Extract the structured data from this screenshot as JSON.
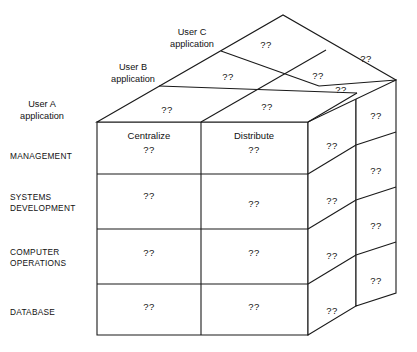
{
  "diagram": {
    "question_mark": "??",
    "depth_labels": [
      {
        "line1": "User A",
        "line2": "application"
      },
      {
        "line1": "User B",
        "line2": "application"
      },
      {
        "line1": "User C",
        "line2": "application"
      }
    ],
    "row_labels": [
      {
        "line1": "MANAGEMENT",
        "line2": ""
      },
      {
        "line1": "SYSTEMS",
        "line2": "DEVELOPMENT"
      },
      {
        "line1": "COMPUTER",
        "line2": "OPERATIONS"
      },
      {
        "line1": "DATABASE",
        "line2": ""
      }
    ],
    "column_headers": [
      "Centralize",
      "Distribute"
    ],
    "front_face": {
      "rows": [
        {
          "label": "MANAGEMENT",
          "cells": [
            "??",
            "??"
          ]
        },
        {
          "label": "SYSTEMS DEVELOPMENT",
          "cells": [
            "??",
            "??"
          ]
        },
        {
          "label": "COMPUTER OPERATIONS",
          "cells": [
            "??",
            "??"
          ]
        },
        {
          "label": "DATABASE",
          "cells": [
            "??",
            "??"
          ]
        }
      ]
    },
    "side_face": {
      "near_column": [
        "??",
        "??",
        "??",
        "??"
      ],
      "far_column": [
        "??",
        "??",
        "??",
        "??"
      ]
    },
    "top_face": {
      "layers": [
        {
          "name": "User A application",
          "cells": [
            "??",
            "??"
          ],
          "side_cell": "??"
        },
        {
          "name": "User B application",
          "cells": [
            "??",
            "??"
          ],
          "side_cell": "??"
        },
        {
          "name": "User C application",
          "cells": [
            "??"
          ],
          "side_cell": ""
        }
      ]
    },
    "colors": {
      "line": "#1a1a1a",
      "face": "#ffffff",
      "text": "#111111"
    }
  }
}
